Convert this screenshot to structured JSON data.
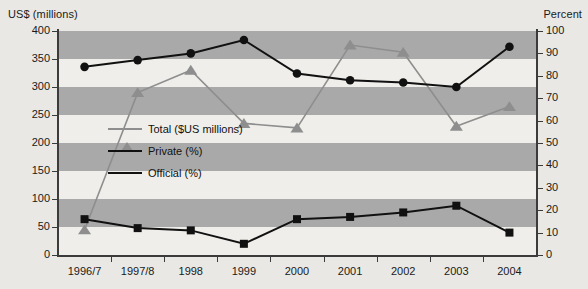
{
  "axes": {
    "left_title": "US$ (millions)",
    "right_title": "Percent",
    "left_ticks": [
      "400",
      "350",
      "300",
      "250",
      "200",
      "150",
      "100",
      "50",
      "0"
    ],
    "right_ticks": [
      "100",
      "90",
      "80",
      "70",
      "60",
      "50",
      "40",
      "30",
      "20",
      "10",
      "0"
    ],
    "x_ticks": [
      "1996/7",
      "1997/8",
      "1998",
      "1999",
      "2000",
      "2001",
      "2002",
      "2003",
      "2004"
    ]
  },
  "legend": {
    "items": [
      {
        "label": "Total ($US millions)",
        "marker": "triangle-marker",
        "color": "#8e8e8e"
      },
      {
        "label": "Private (%)",
        "marker": "square-marker",
        "color": "#111111"
      },
      {
        "label": "Official (%)",
        "marker": "circle-marker",
        "color": "#111111"
      }
    ]
  },
  "colors": {
    "band": "#a9a9a9",
    "plot_background": "#efeeea",
    "page_background": "#e9e8e4",
    "total_series": "#8e8e8e",
    "private_series": "#111111",
    "official_series": "#111111",
    "axis": "#3b3b3b"
  },
  "chart_data": {
    "type": "line",
    "title": "",
    "xlabel": "",
    "ylabel": "US$ (millions)",
    "y2label": "Percent",
    "ylim": [
      0,
      400
    ],
    "y2lim": [
      0,
      100
    ],
    "grid": "horizontal-bands",
    "legend_position": "inside-center-left",
    "categories": [
      "1996/7",
      "1997/8",
      "1998",
      "1999",
      "2000",
      "2001",
      "2002",
      "2003",
      "2004"
    ],
    "series": [
      {
        "name": "Total ($US millions)",
        "axis": "left",
        "unit": "US$ millions",
        "marker": "triangle",
        "color": "#8e8e8e",
        "values": [
          45,
          290,
          330,
          235,
          227,
          375,
          362,
          230,
          265
        ]
      },
      {
        "name": "Private (%)",
        "axis": "right",
        "unit": "percent",
        "marker": "square",
        "color": "#111111",
        "values": [
          16,
          12,
          11,
          5,
          16,
          17,
          19,
          22,
          10
        ]
      },
      {
        "name": "Official (%)",
        "axis": "right",
        "unit": "percent",
        "marker": "circle",
        "color": "#111111",
        "values": [
          84,
          87,
          90,
          96,
          81,
          78,
          77,
          75,
          93
        ]
      }
    ]
  }
}
